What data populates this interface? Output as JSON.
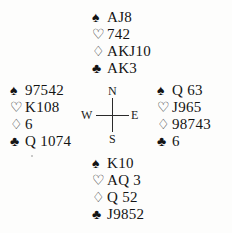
{
  "diagram": {
    "type": "bridge-hand-diagram",
    "suit_symbols": {
      "spade": "♠",
      "heart": "♡",
      "diamond": "♢",
      "club": "♣"
    },
    "compass": {
      "north": "N",
      "south": "S",
      "west": "W",
      "east": "E"
    },
    "hands": {
      "north": {
        "label": "North",
        "spades": "AJ8",
        "hearts": "742",
        "diamonds": "AKJ10",
        "clubs": "AK3"
      },
      "west": {
        "label": "West",
        "spades": "97542",
        "hearts": "K108",
        "diamonds": "6",
        "clubs": "Q 1074"
      },
      "east": {
        "label": "East",
        "spades": "Q 63",
        "hearts": "J965",
        "diamonds": "98743",
        "clubs": "6"
      },
      "south": {
        "label": "South",
        "spades": "K10",
        "hearts": "AQ 3",
        "diamonds": "Q 52",
        "clubs": "J9852"
      }
    }
  }
}
